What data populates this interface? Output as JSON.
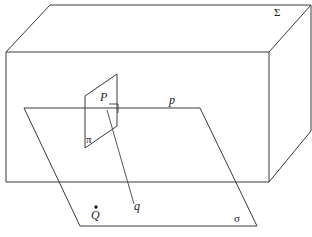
{
  "figure": {
    "canvas": {
      "width": 312,
      "height": 237,
      "background": "#ffffff"
    },
    "stroke_color": "#3a3a3a",
    "text_color": "#1a1a1a"
  },
  "labels": {
    "solid_sigma_capital": "Σ",
    "point_p": "P",
    "point_q": "Q",
    "line_p": "p",
    "line_q": "q",
    "plane_pi": "π",
    "plane_sigma": "σ"
  },
  "geometry": {
    "box": {
      "name": "rectangular-solid",
      "front_face": [
        [
          6,
          52
        ],
        [
          269,
          52
        ],
        [
          269,
          182
        ],
        [
          6,
          182
        ]
      ],
      "top_back_edge": [
        [
          50,
          5
        ],
        [
          311,
          5
        ]
      ],
      "top_left_diagonal": [
        [
          6,
          52
        ],
        [
          50,
          5
        ]
      ],
      "top_right_diagonal": [
        [
          269,
          52
        ],
        [
          311,
          5
        ]
      ],
      "right_back_edge": [
        [
          311,
          5
        ],
        [
          311,
          131
        ]
      ],
      "bottom_right_diagonal": [
        [
          269,
          182
        ],
        [
          311,
          131
        ]
      ]
    },
    "plane_sigma": {
      "name": "horizontal-plane-sigma",
      "corners": [
        [
          24,
          108
        ],
        [
          200,
          108
        ],
        [
          257,
          226
        ],
        [
          80,
          226
        ]
      ]
    },
    "plane_pi": {
      "name": "vertical-plane-pi",
      "corners": [
        [
          85,
          96
        ],
        [
          117,
          74
        ],
        [
          117,
          126
        ],
        [
          85,
          148
        ]
      ]
    },
    "line_p": {
      "name": "line-p",
      "from": [
        24,
        108
      ],
      "to": [
        200,
        108
      ]
    },
    "line_q": {
      "name": "line-q",
      "from": [
        107,
        110
      ],
      "to": [
        134,
        204
      ]
    },
    "right_angle_mark": {
      "name": "right-angle-mark",
      "points": [
        [
          109,
          105
        ],
        [
          118,
          105
        ],
        [
          118,
          114
        ]
      ]
    },
    "point_p": {
      "x": 107,
      "y": 108
    },
    "point_q": {
      "x": 96,
      "y": 208,
      "dot_radius": 1.6
    }
  },
  "label_positions": {
    "sigma_capital": {
      "x": 274,
      "y": 8,
      "size": 11
    },
    "p_point": {
      "x": 100,
      "y": 92,
      "size": 12
    },
    "p_line": {
      "x": 169,
      "y": 95,
      "size": 12
    },
    "pi_plane": {
      "x": 86,
      "y": 136,
      "size": 11
    },
    "q_line": {
      "x": 134,
      "y": 201,
      "size": 12
    },
    "q_point": {
      "x": 91,
      "y": 210,
      "size": 12
    },
    "sigma_plane": {
      "x": 234,
      "y": 213,
      "size": 11
    }
  }
}
